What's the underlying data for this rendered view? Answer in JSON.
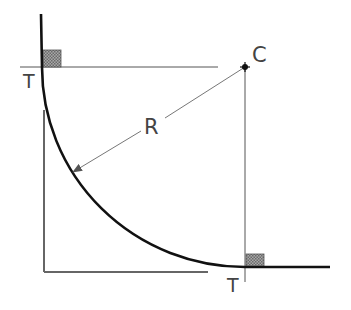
{
  "diagram": {
    "title": "",
    "labels": {
      "tangent_point_start": "T",
      "tangent_point_end": "T",
      "radius": "R",
      "center": "C"
    },
    "colors": {
      "curve": "#111111",
      "guide": "#555555",
      "frame": "#666666",
      "hatch_fill": "#8a8a8a",
      "text": "#444444"
    }
  }
}
